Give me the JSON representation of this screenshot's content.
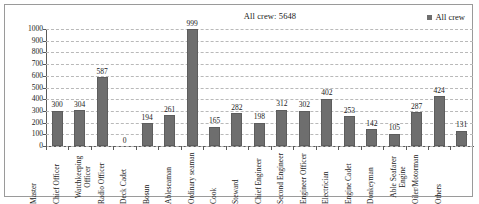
{
  "chart": {
    "title": "All crew: 5648",
    "legend": {
      "label": "All crew",
      "swatch_color": "#6e6e6e",
      "position": "top-right"
    },
    "bar_color": "#6e6e6e",
    "grid": "horizontal-dashed"
  },
  "chart_data": {
    "type": "bar",
    "title": "All crew: 5648",
    "xlabel": "",
    "ylabel": "",
    "ylim": [
      0,
      1000
    ],
    "yticks": [
      0,
      100,
      200,
      300,
      400,
      500,
      600,
      700,
      800,
      900,
      1000
    ],
    "ytick_labels": [
      "0",
      "100",
      "200",
      "300",
      "400",
      "500",
      "600",
      "700",
      "800",
      "900",
      "1000"
    ],
    "grid": true,
    "legend_position": "top right",
    "series": [
      {
        "name": "All crew",
        "values": [
          300,
          304,
          587,
          0,
          194,
          261,
          999,
          165,
          282,
          198,
          312,
          302,
          402,
          253,
          142,
          105,
          287,
          424,
          131
        ]
      }
    ],
    "categories": [
      "Master",
      "Chief Officer",
      "Watchkeeping Officer",
      "Radio Officer",
      "Deck Cadet",
      "Bosun",
      "Ableseaman",
      "Ordinary seaman",
      "Cook",
      "Steward",
      "Chief Engineer",
      "Second Engineer",
      "Engineer Officer",
      "Electrician",
      "Engine Cadet",
      "Donkeyman",
      "Able Seafarer Engine",
      "Oiler/Motorman",
      "Others"
    ],
    "data_labels": [
      "300",
      "304",
      "587",
      "0",
      "194",
      "261",
      "999",
      "165",
      "282",
      "198",
      "312",
      "302",
      "402",
      "253",
      "142",
      "105",
      "287",
      "424",
      "131"
    ],
    "total_annotation": "All crew: 5648"
  }
}
